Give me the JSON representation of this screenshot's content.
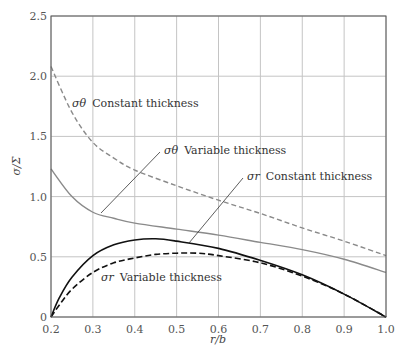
{
  "chart_data": {
    "type": "line",
    "title": "",
    "xlabel": "r/b",
    "ylabel": "σ/Σ",
    "xlim": [
      0.2,
      1.0
    ],
    "ylim": [
      0,
      2.5
    ],
    "xticks": [
      "0.2",
      "0.3",
      "0.4",
      "0.5",
      "0.6",
      "0.7",
      "0.8",
      "0.9",
      "1.0"
    ],
    "yticks": [
      "0",
      "0.5",
      "1.0",
      "1.5",
      "2.0",
      "2.5"
    ],
    "grid": true,
    "legend": "inline annotations",
    "series": [
      {
        "name": "σθ Constant thickness",
        "symbol": "σθ",
        "text": "Constant thickness",
        "color": "#8a8a8a",
        "style": "dashed",
        "x": [
          0.2,
          0.25,
          0.3,
          0.35,
          0.4,
          0.5,
          0.6,
          0.7,
          0.8,
          0.9,
          1.0
        ],
        "y": [
          2.08,
          1.7,
          1.45,
          1.32,
          1.22,
          1.09,
          0.97,
          0.86,
          0.74,
          0.63,
          0.51
        ]
      },
      {
        "name": "σθ Variable thickness",
        "symbol": "σθ",
        "text": "Variable thickness",
        "color": "#8a8a8a",
        "style": "solid",
        "x": [
          0.2,
          0.25,
          0.3,
          0.35,
          0.4,
          0.5,
          0.6,
          0.7,
          0.8,
          0.9,
          1.0
        ],
        "y": [
          1.23,
          1.0,
          0.87,
          0.82,
          0.78,
          0.73,
          0.68,
          0.62,
          0.56,
          0.48,
          0.37
        ]
      },
      {
        "name": "σr Constant thickness",
        "symbol": "σr",
        "text": "Constant thickness",
        "color": "#111111",
        "style": "solid",
        "x": [
          0.2,
          0.22,
          0.25,
          0.3,
          0.35,
          0.4,
          0.45,
          0.5,
          0.6,
          0.7,
          0.8,
          0.9,
          1.0
        ],
        "y": [
          0.0,
          0.16,
          0.33,
          0.51,
          0.6,
          0.64,
          0.65,
          0.63,
          0.57,
          0.47,
          0.35,
          0.19,
          0.0
        ]
      },
      {
        "name": "σr Variable thickness",
        "symbol": "σr",
        "text": "Variable thickness",
        "color": "#111111",
        "style": "dashed",
        "x": [
          0.2,
          0.22,
          0.25,
          0.3,
          0.35,
          0.4,
          0.45,
          0.5,
          0.55,
          0.6,
          0.7,
          0.8,
          0.9,
          1.0
        ],
        "y": [
          0.0,
          0.1,
          0.23,
          0.37,
          0.45,
          0.49,
          0.52,
          0.53,
          0.53,
          0.51,
          0.45,
          0.34,
          0.19,
          0.0
        ]
      }
    ]
  }
}
